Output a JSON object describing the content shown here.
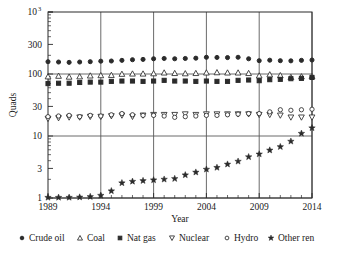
{
  "chart_data": {
    "type": "scatter",
    "title": "",
    "xlabel": "Year",
    "ylabel": "Quads",
    "xlim": [
      1989,
      2014
    ],
    "ylim": [
      1,
      1000
    ],
    "yscale": "log",
    "xticks": [
      1989,
      1994,
      1999,
      2004,
      2009,
      2014
    ],
    "xticklabels": [
      "1989",
      "1994",
      "1999",
      "2004",
      "2009",
      "2014"
    ],
    "yticks": [
      1,
      3,
      10,
      30,
      100,
      300,
      1000
    ],
    "yticklabels": [
      "1",
      "3",
      "10",
      "30",
      "100",
      "300",
      "10"
    ],
    "ytick_top_exponent": "3",
    "grid": "major gridlines at y=1, y=10, y=100 and x=1994, 1999, 2004, 2009, 2014",
    "legend_position": "below-axes",
    "x": [
      1989,
      1990,
      1991,
      1992,
      1993,
      1994,
      1995,
      1996,
      1997,
      1998,
      1999,
      2000,
      2001,
      2002,
      2003,
      2004,
      2005,
      2006,
      2007,
      2008,
      2009,
      2010,
      2011,
      2012,
      2013,
      2014
    ],
    "series": [
      {
        "name": "Crude oil",
        "marker": "filled-circle",
        "values": [
          158,
          156,
          154,
          156,
          158,
          161,
          162,
          166,
          170,
          172,
          176,
          178,
          176,
          178,
          180,
          186,
          185,
          184,
          186,
          176,
          164,
          167,
          164,
          163,
          166,
          168
        ]
      },
      {
        "name": "Coal",
        "marker": "open-triangle-up",
        "values": [
          91,
          93,
          90,
          91,
          94,
          95,
          96,
          100,
          101,
          101,
          102,
          105,
          103,
          102,
          103,
          105,
          106,
          105,
          105,
          103,
          94,
          98,
          95,
          89,
          91,
          92
        ]
      },
      {
        "name": "Nat gas",
        "marker": "filled-square",
        "values": [
          70,
          71,
          71,
          73,
          74,
          74,
          76,
          77,
          77,
          76,
          77,
          79,
          77,
          77,
          76,
          77,
          76,
          76,
          79,
          80,
          78,
          81,
          82,
          84,
          85,
          88
        ]
      },
      {
        "name": "Nuclear",
        "marker": "open-triangle-down",
        "values": [
          19.0,
          19.5,
          20.0,
          20.0,
          20.5,
          20.5,
          21.0,
          21.5,
          20.5,
          21.5,
          22.0,
          22.0,
          22.0,
          22.5,
          22.0,
          22.5,
          22.5,
          22.5,
          22.5,
          22.5,
          22.0,
          22.0,
          21.5,
          20.0,
          20.0,
          20.0
        ]
      },
      {
        "name": "Hydro",
        "marker": "open-circle",
        "values": [
          20.5,
          21.0,
          21.5,
          20.5,
          21.5,
          21.0,
          22.0,
          23.0,
          22.0,
          21.5,
          21.5,
          21.0,
          20.0,
          20.5,
          21.0,
          21.5,
          21.5,
          22.0,
          22.5,
          23.0,
          23.0,
          24.5,
          26.5,
          26.0,
          26.5,
          27.0
        ]
      },
      {
        "name": "Other ren",
        "marker": "filled-star",
        "values": [
          1.02,
          1.02,
          1.02,
          1.03,
          1.05,
          1.1,
          1.3,
          1.75,
          1.85,
          1.9,
          1.95,
          2.0,
          2.05,
          2.35,
          2.6,
          2.9,
          3.1,
          3.5,
          3.9,
          4.6,
          5.1,
          5.9,
          6.7,
          8.2,
          11.0,
          13.5
        ]
      }
    ]
  },
  "legend": {
    "items": [
      {
        "label": "Crude oil",
        "marker": "filled-circle"
      },
      {
        "label": "Coal",
        "marker": "open-triangle-up"
      },
      {
        "label": "Nat gas",
        "marker": "filled-square"
      },
      {
        "label": "Nuclear",
        "marker": "open-triangle-down"
      },
      {
        "label": "Hydro",
        "marker": "open-circle"
      },
      {
        "label": "Other ren",
        "marker": "filled-star"
      }
    ]
  },
  "colors": {
    "ink": "#2b2b2b",
    "grid": "#5a5a5a",
    "background": "#ffffff"
  }
}
